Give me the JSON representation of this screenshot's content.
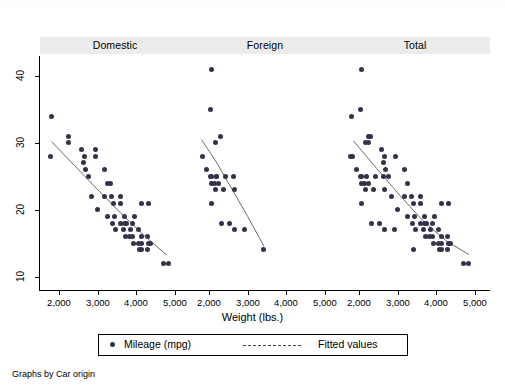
{
  "figure": {
    "x_axis_title": "Weight (lbs.)",
    "note": "Graphs by Car origin",
    "panel_titles": [
      "Domestic",
      "Foreign",
      "Total"
    ],
    "y_ticks": [
      "10",
      "20",
      "30",
      "40"
    ],
    "x_ticks": [
      "2,000",
      "3,000",
      "4,000",
      "5,000"
    ]
  },
  "legend": {
    "marker_label": "Mileage (mpg)",
    "line_label": "Fitted values",
    "marker_icon": "filled-circle-icon",
    "line_icon": "dashed-line-icon"
  },
  "colors": {
    "marker": "#32324b",
    "fit_line": "#6b6b6b",
    "panel_header_bg": "#ececec",
    "axis": "#000000"
  },
  "chart_data": {
    "type": "scatter",
    "title": "",
    "xlabel": "Weight (lbs.)",
    "ylabel": "Mileage (mpg)",
    "xlim": [
      1500,
      5400
    ],
    "ylim": [
      8,
      43
    ],
    "xticks": [
      2000,
      3000,
      4000,
      5000
    ],
    "yticks": [
      10,
      20,
      30,
      40
    ],
    "grid": false,
    "legend_position": "bottom-center",
    "panel_variable": "Car origin",
    "panels": [
      {
        "name": "Domestic",
        "series": [
          {
            "name": "Mileage (mpg)",
            "type": "scatter",
            "points": [
              [
                1800,
                34
              ],
              [
                2230,
                31
              ],
              [
                1760,
                28
              ],
              [
                2230,
                30
              ],
              [
                2650,
                28
              ],
              [
                2930,
                28
              ],
              [
                2640,
                27
              ],
              [
                3180,
                26
              ],
              [
                2690,
                26
              ],
              [
                3170,
                22
              ],
              [
                2830,
                22
              ],
              [
                3350,
                22
              ],
              [
                3600,
                22
              ],
              [
                4130,
                21
              ],
              [
                4330,
                21
              ],
              [
                2930,
                29
              ],
              [
                3000,
                20
              ],
              [
                3430,
                19
              ],
              [
                3380,
                18
              ],
              [
                3600,
                18
              ],
              [
                3700,
                18
              ],
              [
                3740,
                18
              ],
              [
                3900,
                18
              ],
              [
                3470,
                17
              ],
              [
                3670,
                17
              ],
              [
                3850,
                17
              ],
              [
                4060,
                17
              ],
              [
                4130,
                16
              ],
              [
                3720,
                16
              ],
              [
                3830,
                16
              ],
              [
                3900,
                16
              ],
              [
                4290,
                16
              ],
              [
                3940,
                15
              ],
              [
                4060,
                15
              ],
              [
                4130,
                15
              ],
              [
                4330,
                15
              ],
              [
                4360,
                15
              ],
              [
                4130,
                14
              ],
              [
                4290,
                14
              ],
              [
                4840,
                12
              ],
              [
                4720,
                12
              ],
              [
                3420,
                21
              ],
              [
                3250,
                24
              ],
              [
                3330,
                24
              ],
              [
                3600,
                21
              ],
              [
                3955,
                19
              ],
              [
                2750,
                25
              ],
              [
                2580,
                29
              ],
              [
                3260,
                19
              ],
              [
                3690,
                19
              ],
              [
                4080,
                14
              ]
            ]
          },
          {
            "name": "Fitted values",
            "type": "line",
            "points": [
              [
                1800,
                30.2
              ],
              [
                2400,
                26.6
              ],
              [
                3000,
                23.0
              ],
              [
                3600,
                19.5
              ],
              [
                4200,
                16.2
              ],
              [
                4800,
                13.2
              ]
            ]
          }
        ]
      },
      {
        "name": "Foreign",
        "series": [
          {
            "name": "Mileage (mpg)",
            "type": "scatter",
            "points": [
              [
                2050,
                41
              ],
              [
                2040,
                35
              ],
              [
                2280,
                31
              ],
              [
                2160,
                30
              ],
              [
                1830,
                28
              ],
              [
                1930,
                26
              ],
              [
                2020,
                25
              ],
              [
                2200,
                25
              ],
              [
                2070,
                25
              ],
              [
                2410,
                25
              ],
              [
                2640,
                25
              ],
              [
                2230,
                24
              ],
              [
                2050,
                24
              ],
              [
                2130,
                24
              ],
              [
                2160,
                23
              ],
              [
                2650,
                23
              ],
              [
                2070,
                21
              ],
              [
                2330,
                18
              ],
              [
                2520,
                18
              ],
              [
                2650,
                17
              ],
              [
                2910,
                17
              ],
              [
                3420,
                14
              ],
              [
                2180,
                25
              ],
              [
                2370,
                23
              ]
            ]
          },
          {
            "name": "Fitted values",
            "type": "line",
            "points": [
              [
                1800,
                30.5
              ],
              [
                2200,
                27.0
              ],
              [
                2600,
                23.0
              ],
              [
                3000,
                19.0
              ],
              [
                3420,
                14.6
              ]
            ]
          }
        ]
      },
      {
        "name": "Total",
        "series": [
          {
            "name": "Mileage (mpg)",
            "type": "scatter",
            "points": [
              [
                2050,
                41
              ],
              [
                2040,
                35
              ],
              [
                1800,
                34
              ],
              [
                2230,
                31
              ],
              [
                2280,
                31
              ],
              [
                2160,
                30
              ],
              [
                2230,
                30
              ],
              [
                1830,
                28
              ],
              [
                1760,
                28
              ],
              [
                2650,
                28
              ],
              [
                2930,
                28
              ],
              [
                2640,
                27
              ],
              [
                1930,
                26
              ],
              [
                2690,
                26
              ],
              [
                3180,
                26
              ],
              [
                2020,
                25
              ],
              [
                2200,
                25
              ],
              [
                2070,
                25
              ],
              [
                2410,
                25
              ],
              [
                2640,
                25
              ],
              [
                2230,
                24
              ],
              [
                2050,
                24
              ],
              [
                2130,
                24
              ],
              [
                3250,
                24
              ],
              [
                2160,
                23
              ],
              [
                2650,
                23
              ],
              [
                2370,
                23
              ],
              [
                3170,
                22
              ],
              [
                2830,
                22
              ],
              [
                3350,
                22
              ],
              [
                3600,
                22
              ],
              [
                2070,
                21
              ],
              [
                4130,
                21
              ],
              [
                4330,
                21
              ],
              [
                3420,
                21
              ],
              [
                3600,
                21
              ],
              [
                3000,
                20
              ],
              [
                3430,
                19
              ],
              [
                3260,
                19
              ],
              [
                3690,
                19
              ],
              [
                3955,
                19
              ],
              [
                2330,
                18
              ],
              [
                2520,
                18
              ],
              [
                3380,
                18
              ],
              [
                3600,
                18
              ],
              [
                3700,
                18
              ],
              [
                3740,
                18
              ],
              [
                3900,
                18
              ],
              [
                2650,
                17
              ],
              [
                2910,
                17
              ],
              [
                3470,
                17
              ],
              [
                3670,
                17
              ],
              [
                3850,
                17
              ],
              [
                4060,
                17
              ],
              [
                4130,
                16
              ],
              [
                3720,
                16
              ],
              [
                3830,
                16
              ],
              [
                3900,
                16
              ],
              [
                4290,
                16
              ],
              [
                3940,
                15
              ],
              [
                4060,
                15
              ],
              [
                4130,
                15
              ],
              [
                4330,
                15
              ],
              [
                4360,
                15
              ],
              [
                3420,
                14
              ],
              [
                4130,
                14
              ],
              [
                4290,
                14
              ],
              [
                4080,
                14
              ],
              [
                4840,
                12
              ],
              [
                4720,
                12
              ],
              [
                2750,
                25
              ],
              [
                2580,
                29
              ]
            ]
          },
          {
            "name": "Fitted values",
            "type": "line",
            "points": [
              [
                1850,
                30.3
              ],
              [
                2450,
                26.2
              ],
              [
                3050,
                22.2
              ],
              [
                3650,
                18.4
              ],
              [
                4250,
                15.4
              ],
              [
                4850,
                13.3
              ]
            ]
          }
        ]
      }
    ]
  }
}
